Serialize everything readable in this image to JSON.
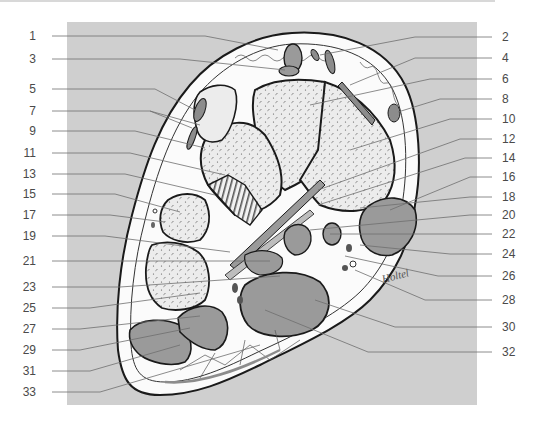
{
  "figure": {
    "type": "anatomical cross-section diagram",
    "colors": {
      "frame_gray": "#cfcfcf",
      "bone_fill": "#ececec",
      "soft_tissue": "#fbfbfb",
      "muscle_fill": "#9a9a9a",
      "tendon_fill": "#8c8c8c",
      "outline": "#1a1a1a",
      "leader_line": "#6e6e6e",
      "label_text": "#4a4a4a"
    },
    "signature": "Holtel"
  },
  "labels": {
    "left": [
      {
        "num": "1",
        "y": 36
      },
      {
        "num": "3",
        "y": 59
      },
      {
        "num": "5",
        "y": 89
      },
      {
        "num": "7",
        "y": 111
      },
      {
        "num": "9",
        "y": 131
      },
      {
        "num": "11",
        "y": 153
      },
      {
        "num": "13",
        "y": 174
      },
      {
        "num": "15",
        "y": 194
      },
      {
        "num": "17",
        "y": 215
      },
      {
        "num": "19",
        "y": 236
      },
      {
        "num": "21",
        "y": 261
      },
      {
        "num": "23",
        "y": 287
      },
      {
        "num": "25",
        "y": 308
      },
      {
        "num": "27",
        "y": 329
      },
      {
        "num": "29",
        "y": 350
      },
      {
        "num": "31",
        "y": 371
      },
      {
        "num": "33",
        "y": 392
      }
    ],
    "right": [
      {
        "num": "2",
        "y": 37
      },
      {
        "num": "4",
        "y": 58
      },
      {
        "num": "6",
        "y": 79
      },
      {
        "num": "8",
        "y": 99
      },
      {
        "num": "10",
        "y": 119
      },
      {
        "num": "12",
        "y": 139
      },
      {
        "num": "14",
        "y": 158
      },
      {
        "num": "16",
        "y": 177
      },
      {
        "num": "18",
        "y": 197
      },
      {
        "num": "20",
        "y": 215
      },
      {
        "num": "22",
        "y": 234
      },
      {
        "num": "24",
        "y": 254
      },
      {
        "num": "26",
        "y": 276
      },
      {
        "num": "28",
        "y": 300
      },
      {
        "num": "30",
        "y": 327
      },
      {
        "num": "32",
        "y": 352
      }
    ]
  }
}
